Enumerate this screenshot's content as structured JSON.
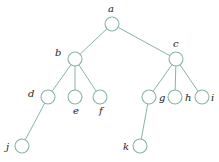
{
  "diagram": {
    "type": "tree",
    "colors": {
      "edge": "#86b5a6",
      "node_stroke": "#86b5a6",
      "node_fill": "#ffffff",
      "label": "#222222"
    },
    "nodes": [
      {
        "id": "a",
        "label": "a",
        "x": 112,
        "y": 24,
        "lx": 108,
        "ly": 12
      },
      {
        "id": "b",
        "label": "b",
        "x": 75,
        "y": 59,
        "lx": 55,
        "ly": 56
      },
      {
        "id": "c",
        "label": "c",
        "x": 176,
        "y": 59,
        "lx": 173,
        "ly": 47
      },
      {
        "id": "d",
        "label": "d",
        "x": 48,
        "y": 97,
        "lx": 28,
        "ly": 97
      },
      {
        "id": "e",
        "label": "e",
        "x": 75,
        "y": 97,
        "lx": 73,
        "ly": 114
      },
      {
        "id": "f",
        "label": "f",
        "x": 100,
        "y": 97,
        "lx": 99,
        "ly": 114
      },
      {
        "id": "g",
        "label": "g",
        "x": 149,
        "y": 97,
        "lx": 159,
        "ly": 101
      },
      {
        "id": "h",
        "label": "h",
        "x": 175,
        "y": 97,
        "lx": 185,
        "ly": 101
      },
      {
        "id": "i",
        "label": "i",
        "x": 202,
        "y": 97,
        "lx": 211,
        "ly": 101
      },
      {
        "id": "j",
        "label": "j",
        "x": 22,
        "y": 146,
        "lx": 6,
        "ly": 150
      },
      {
        "id": "k",
        "label": "k",
        "x": 140,
        "y": 146,
        "lx": 123,
        "ly": 150
      }
    ],
    "edges": [
      [
        "a",
        "b"
      ],
      [
        "a",
        "c"
      ],
      [
        "b",
        "d"
      ],
      [
        "b",
        "e"
      ],
      [
        "b",
        "f"
      ],
      [
        "c",
        "g"
      ],
      [
        "c",
        "h"
      ],
      [
        "c",
        "i"
      ],
      [
        "d",
        "j"
      ],
      [
        "g",
        "k"
      ]
    ],
    "node_radius": 7
  }
}
